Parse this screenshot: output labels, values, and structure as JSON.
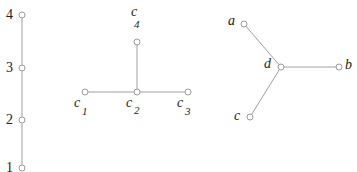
{
  "colors": {
    "edge": "#9a9a9a",
    "node": "#9a9a9a",
    "text": "#222222"
  },
  "graphs": [
    {
      "name": "path",
      "nodes": [
        {
          "id": "4",
          "label": "4",
          "x": 22,
          "y": 15
        },
        {
          "id": "3",
          "label": "3",
          "x": 22,
          "y": 68
        },
        {
          "id": "2",
          "label": "2",
          "x": 22,
          "y": 120
        },
        {
          "id": "1",
          "label": "1",
          "x": 22,
          "y": 168
        }
      ],
      "edges": [
        [
          "4",
          "3"
        ],
        [
          "3",
          "2"
        ],
        [
          "2",
          "1"
        ]
      ]
    },
    {
      "name": "t-tree",
      "nodes": [
        {
          "id": "c4",
          "label": "c",
          "sub": "4",
          "x": 137,
          "y": 42
        },
        {
          "id": "c1",
          "label": "c",
          "sub": "1",
          "x": 85,
          "y": 92
        },
        {
          "id": "c2",
          "label": "c",
          "sub": "2",
          "x": 137,
          "y": 92
        },
        {
          "id": "c3",
          "label": "c",
          "sub": "3",
          "x": 188,
          "y": 92
        }
      ],
      "edges": [
        [
          "c4",
          "c2"
        ],
        [
          "c1",
          "c2"
        ],
        [
          "c2",
          "c3"
        ]
      ]
    },
    {
      "name": "star",
      "nodes": [
        {
          "id": "a",
          "label": "a",
          "x": 244,
          "y": 24
        },
        {
          "id": "d",
          "label": "d",
          "x": 281,
          "y": 67
        },
        {
          "id": "b",
          "label": "b",
          "x": 339,
          "y": 67
        },
        {
          "id": "c",
          "label": "c",
          "x": 250,
          "y": 117
        }
      ],
      "edges": [
        [
          "a",
          "d"
        ],
        [
          "d",
          "b"
        ],
        [
          "d",
          "c"
        ]
      ]
    }
  ],
  "labels": {
    "n4": "4",
    "n3": "3",
    "n2": "2",
    "n1": "1",
    "c": "c",
    "c4sub": "4",
    "c1sub": "1",
    "c2sub": "2",
    "c3sub": "3",
    "a": "a",
    "b": "b",
    "cc": "c",
    "d": "d"
  }
}
